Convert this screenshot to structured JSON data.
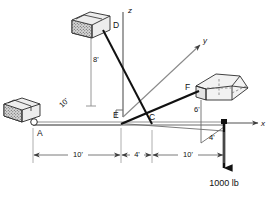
{
  "figure": {
    "background_color": "#ffffff",
    "line_color": "#3f3f3f",
    "heavy_line_color": "#111111",
    "block_fill": "#d9d9d9",
    "block_stroke": "#2b2b2b"
  },
  "axes": [
    {
      "id": "z",
      "label": "z",
      "direction": "up"
    },
    {
      "id": "y",
      "label": "y",
      "direction": "up-right"
    },
    {
      "id": "x",
      "label": "x",
      "direction": "right"
    }
  ],
  "points": [
    {
      "id": "A",
      "label": "A",
      "role": "support-pin-at-origin"
    },
    {
      "id": "D",
      "label": "D",
      "role": "upper-cable-anchor-block"
    },
    {
      "id": "E",
      "label": "E",
      "role": "cable-attachment-on-boom"
    },
    {
      "id": "C",
      "label": "C",
      "role": "cable-attachment-on-boom"
    },
    {
      "id": "F",
      "label": "F",
      "role": "right-cable-anchor-block"
    }
  ],
  "dimensions": [
    {
      "id": "d-ae",
      "label": "10'",
      "orientation": "horizontal",
      "span": "A to E"
    },
    {
      "id": "d-ec",
      "label": "4'",
      "orientation": "horizontal",
      "span": "E to C"
    },
    {
      "id": "d-c-load",
      "label": "10'",
      "orientation": "horizontal",
      "span": "C to load point"
    },
    {
      "id": "d-8",
      "label": "8'",
      "orientation": "vertical",
      "span": "D height above y axis"
    },
    {
      "id": "d-10-diag",
      "label": "10'",
      "orientation": "diagonal",
      "span": "A along y axis"
    },
    {
      "id": "d-6",
      "label": "6'",
      "orientation": "vertical",
      "span": "F height above boom"
    },
    {
      "id": "d-4",
      "label": "4'",
      "orientation": "diagonal",
      "span": "offset to load point"
    }
  ],
  "load": {
    "label": "1000 lb",
    "direction": "down",
    "applied_at": "right end of boom"
  },
  "members": [
    {
      "id": "boom",
      "from": "A",
      "to": "load-point",
      "style": "double-line-beam"
    },
    {
      "id": "cable-DC",
      "from": "D",
      "to": "C",
      "style": "heavy"
    },
    {
      "id": "cable-EF",
      "from": "E",
      "to": "F",
      "style": "heavy"
    }
  ]
}
